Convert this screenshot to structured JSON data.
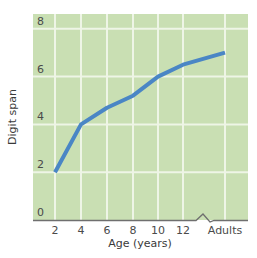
{
  "chart_data": {
    "type": "line",
    "title": "",
    "xlabel": "Age (years)",
    "ylabel": "Digit span",
    "categories": [
      "2",
      "4",
      "6",
      "8",
      "10",
      "12",
      "Adults"
    ],
    "series": [
      {
        "name": "Digit span",
        "values": [
          2.0,
          4.0,
          4.7,
          5.2,
          6.0,
          6.5,
          7.0
        ]
      }
    ],
    "yticks": [
      "0",
      "2",
      "4",
      "6",
      "8"
    ],
    "ylim": [
      0,
      8.5
    ],
    "grid": true,
    "axis_break": "between 12 and Adults",
    "legend": "none",
    "colors": {
      "plot_bg": "#c9dfb3",
      "grid": "#eef5e6",
      "line": "#4a86c5",
      "axis": "#6f6f6f"
    }
  }
}
